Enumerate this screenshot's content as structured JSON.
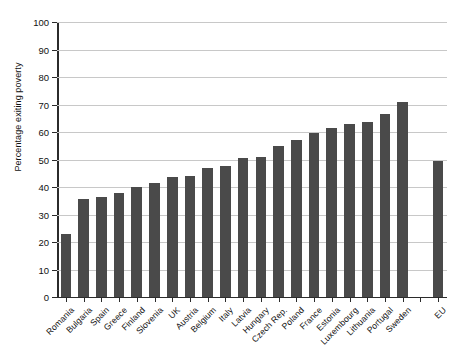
{
  "figure": {
    "title_sliver": "",
    "bar_color": "#4a4a4a",
    "grid_color": "#c8c8c8",
    "axis_color": "#2b2b2b"
  },
  "chart_data": {
    "type": "bar",
    "title": "",
    "xlabel": "",
    "ylabel": "Percentage exiting poverty",
    "ylim": [
      0,
      100
    ],
    "ytick_labels": [
      "0",
      "10",
      "20",
      "30",
      "40",
      "50",
      "60",
      "70",
      "80",
      "90",
      "100"
    ],
    "ytick_values": [
      0,
      10,
      20,
      30,
      40,
      50,
      60,
      70,
      80,
      90,
      100
    ],
    "grid": true,
    "legend": "none",
    "categories": [
      "Romania",
      "Bulgaria",
      "Spain",
      "Greece",
      "Finland",
      "Slovenia",
      "UK",
      "Austria",
      "Belgium",
      "Italy",
      "Latvia",
      "Hungary",
      "Czech Rep.",
      "Poland",
      "France",
      "Estonia",
      "Luxembourg",
      "Lithuania",
      "Portugal",
      "Sweden",
      "",
      "EU"
    ],
    "values": [
      23,
      35.5,
      36.5,
      38,
      40,
      41.5,
      43.5,
      44,
      47,
      47.5,
      50.5,
      51,
      55,
      57,
      59.5,
      61.5,
      63,
      63.5,
      66.5,
      71,
      null,
      49.5
    ]
  }
}
